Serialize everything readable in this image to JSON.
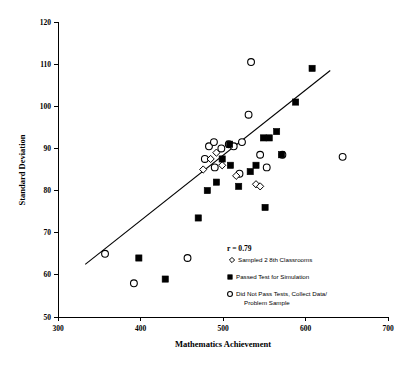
{
  "chart_data": {
    "type": "scatter",
    "title": "",
    "xlabel": "Mathematics Achievement",
    "ylabel": "Standard Deviation",
    "xlim": [
      300,
      700
    ],
    "ylim": [
      50,
      120
    ],
    "xticks": [
      300,
      400,
      500,
      600,
      700
    ],
    "yticks": [
      50,
      60,
      70,
      80,
      90,
      100,
      110,
      120
    ],
    "grid": false,
    "annotation": "r = 0.79",
    "correlation": 0.79,
    "legend_position": "inside-lower-right",
    "trendline": {
      "type": "linear",
      "x_start": 333,
      "y_start": 62.5,
      "x_end": 630,
      "y_end": 108.5
    },
    "series": [
      {
        "name": "Sampled 2 8th Classrooms",
        "marker": "open-diamond",
        "points": [
          [
            485,
            87.5
          ],
          [
            492,
            89.0
          ],
          [
            499,
            86.0
          ],
          [
            540,
            81.5
          ],
          [
            545,
            81.0
          ],
          [
            476,
            85.0
          ],
          [
            516,
            83.5
          ]
        ]
      },
      {
        "name": "Passed Test for Simulation",
        "marker": "filled-square",
        "points": [
          [
            398,
            64.0
          ],
          [
            430,
            59.0
          ],
          [
            470,
            73.5
          ],
          [
            481,
            80.0
          ],
          [
            492,
            82.0
          ],
          [
            499,
            87.5
          ],
          [
            509,
            86.0
          ],
          [
            519,
            81.0
          ],
          [
            533,
            84.5
          ],
          [
            540,
            86.0
          ],
          [
            549,
            92.5
          ],
          [
            556,
            92.5
          ],
          [
            551,
            76.0
          ],
          [
            565,
            94.0
          ],
          [
            571,
            88.5
          ],
          [
            588,
            101.0
          ],
          [
            608,
            109.0
          ],
          [
            508,
            91.0
          ]
        ]
      },
      {
        "name": "Did Not Pass Tests, Collect Data/ Problem Sample",
        "marker": "open-circle",
        "points": [
          [
            357,
            65.0
          ],
          [
            392,
            58.0
          ],
          [
            457,
            64.0
          ],
          [
            478,
            87.5
          ],
          [
            483,
            90.5
          ],
          [
            489,
            91.5
          ],
          [
            490,
            85.5
          ],
          [
            498,
            90.0
          ],
          [
            507,
            91.0
          ],
          [
            513,
            90.5
          ],
          [
            523,
            91.5
          ],
          [
            531,
            98.0
          ],
          [
            534,
            110.5
          ],
          [
            545,
            88.5
          ],
          [
            553,
            85.5
          ],
          [
            572,
            88.5
          ],
          [
            645,
            88.0
          ],
          [
            520,
            84.0
          ]
        ]
      }
    ]
  },
  "axes": {
    "y_title": "Standard Deviation",
    "x_title": "Mathematics Achievement",
    "y_tick_labels": [
      "50",
      "60",
      "70",
      "80",
      "90",
      "100",
      "110",
      "120"
    ],
    "x_tick_labels": [
      "300",
      "400",
      "500",
      "600",
      "700"
    ]
  },
  "legend": {
    "correlation_label": "r = 0.79",
    "items": [
      {
        "marker": "open-diamond",
        "label": "Sampled 2 8th Classrooms",
        "label_line2": ""
      },
      {
        "marker": "filled-square",
        "label": "Passed Test for Simulation",
        "label_line2": ""
      },
      {
        "marker": "open-circle",
        "label": "Did Not Pass Tests, Collect Data/",
        "label_line2": "Problem Sample"
      }
    ]
  },
  "colors": {
    "foreground": "#000000",
    "background": "#ffffff"
  }
}
